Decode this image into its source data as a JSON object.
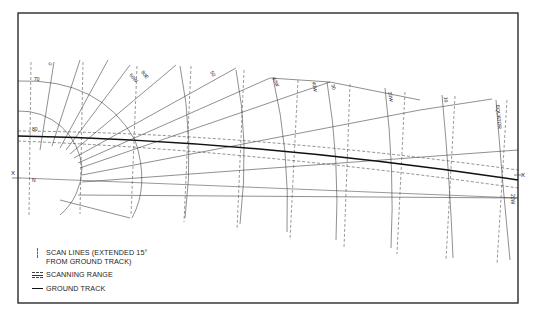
{
  "figure": {
    "axis_marker_left": "X",
    "axis_marker_right": "X",
    "pole_label": "N",
    "parallel_labels": {
      "lat_70": "70",
      "lat_80": "80"
    },
    "meridian_labels": [
      {
        "text": "0",
        "x": 51,
        "y": 66,
        "rot": -60
      },
      {
        "text": "60W",
        "x": 129,
        "y": 75,
        "rot": 50
      },
      {
        "text": "80W",
        "x": 137,
        "y": 80,
        "rot": 40
      },
      {
        "text": "80E",
        "x": 144,
        "y": 72,
        "rot": 55
      },
      {
        "text": "50",
        "x": 210,
        "y": 75,
        "rot": 60
      },
      {
        "text": "40W",
        "x": 272,
        "y": 80,
        "rot": 65
      },
      {
        "text": "40W",
        "x": 312,
        "y": 84,
        "rot": 80
      },
      {
        "text": "30",
        "x": 332,
        "y": 87,
        "rot": 70
      },
      {
        "text": "20W",
        "x": 388,
        "y": 97,
        "rot": 80
      },
      {
        "text": "10",
        "x": 444,
        "y": 99,
        "rot": 85
      },
      {
        "text": "20W",
        "x": 513,
        "y": 196,
        "rot": 90
      }
    ],
    "equator_label": "EQUATOR"
  },
  "legend": {
    "items": [
      {
        "symbol": "scan-lines",
        "label": "SCAN LINES (EXTENDED 15° FROM GROUND TRACK)"
      },
      {
        "symbol": "scanning-range",
        "label": "SCANNING RANGE"
      },
      {
        "symbol": "ground-track",
        "label": "GROUND TRACK"
      }
    ]
  },
  "colors": {
    "ink": "#1a1a1a",
    "grid": "#333333",
    "dash": "#555555",
    "background": "#ffffff"
  }
}
